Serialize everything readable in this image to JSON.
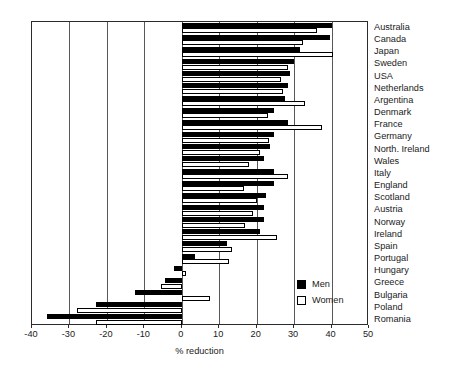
{
  "chart": {
    "type": "bar",
    "orientation": "horizontal",
    "title": "",
    "xlabel": "% reduction",
    "ylabel": "",
    "xlim": [
      -40,
      50
    ],
    "xticks": [
      -40,
      -30,
      -20,
      -10,
      0,
      10,
      20,
      30,
      40,
      50
    ],
    "xticklabels": [
      "-40",
      "-30",
      "-20",
      "-10",
      "0",
      "10",
      "20",
      "30",
      "40",
      "50"
    ],
    "grid": "vertical",
    "legend": {
      "position": "inside-lower-right",
      "entries": [
        {
          "label": "Men",
          "fill": "#000000",
          "edge": "#000000"
        },
        {
          "label": "Women",
          "fill": "#ffffff",
          "edge": "#000000"
        }
      ]
    },
    "colors": {
      "men": "#000000",
      "women": "#ffffff",
      "edge": "#000000",
      "frame": "#2b2b2b",
      "grid": "#585858",
      "background": "#ffffff"
    }
  },
  "chart_data": {
    "type": "bar",
    "orientation": "horizontal",
    "title": "",
    "xlabel": "% reduction",
    "ylabel": "",
    "xlim": [
      -40,
      50
    ],
    "xticks": [
      -40,
      -30,
      -20,
      -10,
      0,
      10,
      20,
      30,
      40,
      50
    ],
    "grid": true,
    "legend_position": "lower right (inside axes)",
    "categories": [
      "Australia",
      "Canada",
      "Japan",
      "Sweden",
      "USA",
      "Netherlands",
      "Argentina",
      "Denmark",
      "France",
      "Germany",
      "North. Ireland",
      "Wales",
      "Italy",
      "England",
      "Scotland",
      "Austria",
      "Norway",
      "Ireland",
      "Spain",
      "Portugal",
      "Hungary",
      "Greece",
      "Bulgaria",
      "Poland",
      "Romania"
    ],
    "series": [
      {
        "name": "Men",
        "values": [
          40.0,
          39.5,
          31.5,
          30.0,
          29.0,
          28.5,
          27.5,
          24.5,
          28.5,
          24.5,
          23.5,
          22.0,
          24.5,
          24.5,
          22.5,
          22.0,
          22.0,
          21.0,
          12.0,
          3.5,
          -2.0,
          -4.5,
          -12.5,
          -23.0,
          -36.0
        ]
      },
      {
        "name": "Women",
        "values": [
          36.0,
          32.5,
          40.5,
          28.5,
          26.5,
          27.0,
          33.0,
          23.0,
          37.5,
          23.3,
          21.0,
          18.0,
          28.5,
          16.5,
          20.0,
          19.0,
          17.0,
          25.5,
          13.5,
          12.5,
          1.0,
          -5.5,
          7.5,
          -28.0,
          -23.0
        ]
      }
    ]
  }
}
